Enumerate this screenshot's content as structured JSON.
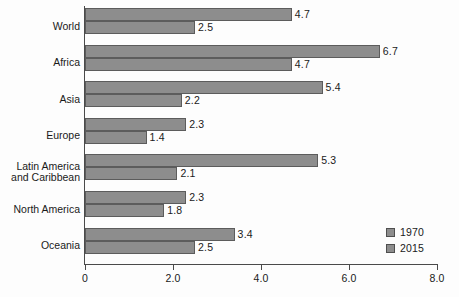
{
  "chart_data": {
    "type": "bar",
    "orientation": "horizontal",
    "title": "",
    "xlabel": "",
    "ylabel": "",
    "xlim": [
      0,
      8.0
    ],
    "xticks": [
      "0",
      "2.0",
      "4.0",
      "6.0",
      "8.0"
    ],
    "xtick_values": [
      0,
      2.0,
      4.0,
      6.0,
      8.0
    ],
    "grid": false,
    "legend_position": "bottom-right",
    "categories": [
      "World",
      "Africa",
      "Asia",
      "Europe",
      "Latin America\nand Caribbean",
      "North America",
      "Oceania"
    ],
    "series": [
      {
        "name": "1970",
        "color": "#8d8d8d",
        "values": [
          4.7,
          6.7,
          5.4,
          2.3,
          5.3,
          2.3,
          3.4
        ],
        "labels": [
          "4.7",
          "6.7",
          "5.4",
          "2.3",
          "5.3",
          "2.3",
          "3.4"
        ]
      },
      {
        "name": "2015",
        "color": "#8d8d8d",
        "values": [
          2.5,
          4.7,
          2.2,
          1.4,
          2.1,
          1.8,
          2.5
        ],
        "labels": [
          "2.5",
          "4.7",
          "2.2",
          "1.4",
          "2.1",
          "1.8",
          "2.5"
        ]
      }
    ]
  },
  "legend": {
    "items": [
      {
        "label": "1970"
      },
      {
        "label": "2015"
      }
    ]
  },
  "axis": {
    "tick_labels": [
      "0",
      "2.0",
      "4.0",
      "6.0",
      "8.0"
    ]
  }
}
